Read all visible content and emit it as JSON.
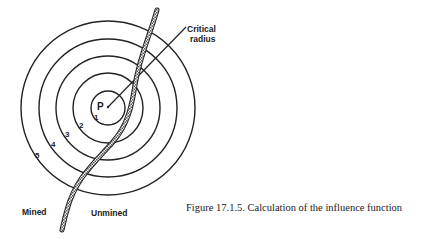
{
  "figure": {
    "caption": "Figure 17.1.5. Calculation of the influence function",
    "point_label": "P",
    "ring_labels": [
      "1",
      "2",
      "3",
      "4",
      "5"
    ],
    "callout": {
      "line1": "Critical",
      "line2": "radius"
    },
    "regions": {
      "left": "Mined",
      "right": "Unmined"
    },
    "colors": {
      "ink": "#222222",
      "background": "#ffffff"
    }
  }
}
